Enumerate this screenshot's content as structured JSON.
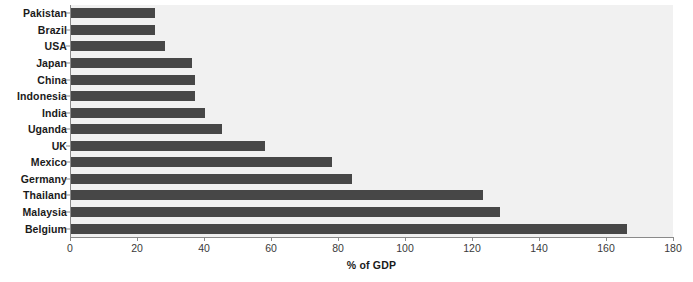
{
  "chart_data": {
    "type": "bar",
    "orientation": "horizontal",
    "title": "",
    "xlabel": "% of GDP",
    "ylabel": "",
    "xlim": [
      0,
      180
    ],
    "xticks": [
      0,
      20,
      40,
      60,
      80,
      100,
      120,
      140,
      160,
      180
    ],
    "grid": false,
    "legend": null,
    "bar_color": "#474747",
    "plot_background": "#f1f1f1",
    "categories": [
      "Pakistan",
      "Brazil",
      "USA",
      "Japan",
      "China",
      "Indonesia",
      "India",
      "Uganda",
      "UK",
      "Mexico",
      "Germany",
      "Thailand",
      "Malaysia",
      "Belgium"
    ],
    "values": [
      25,
      25,
      28,
      36,
      37,
      37,
      40,
      45,
      58,
      78,
      84,
      123,
      128,
      166
    ]
  }
}
